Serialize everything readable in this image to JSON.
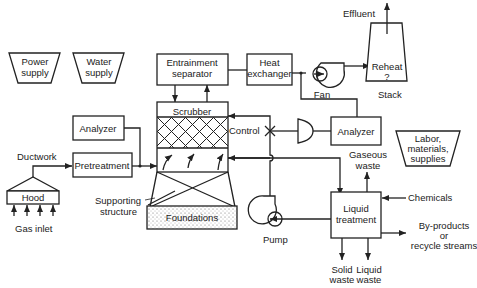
{
  "diagram": {
    "resources": {
      "power": [
        "Power",
        "supply"
      ],
      "water": [
        "Water",
        "supply"
      ],
      "labor": [
        "Labor,",
        "materials,",
        "supplies"
      ]
    },
    "blocks": {
      "entrainment": [
        "Entrainment",
        "separator"
      ],
      "heat_exchanger": [
        "Heat",
        "exchanger"
      ],
      "scrubber": "Scrubber",
      "analyzer_left": "Analyzer",
      "analyzer_right": "Analyzer",
      "pretreatment": "Pretreatment",
      "hood": "Hood",
      "foundations": "Foundations",
      "liquid_treatment": [
        "Liquid",
        "treatment"
      ],
      "stack": [
        "Reheat",
        "?"
      ]
    },
    "labels": {
      "effluent": "Effluent",
      "fan": "Fan",
      "stack": "Stack",
      "control": "Control",
      "ductwork": "Ductwork",
      "gas_inlet": "Gas inlet",
      "supporting": [
        "Supporting",
        "structure"
      ],
      "pump": "Pump",
      "gaseous_waste": [
        "Gaseous",
        "waste"
      ],
      "chemicals": "Chemicals",
      "byproducts": [
        "By-products",
        "or",
        "recycle streams"
      ],
      "solid_waste": [
        "Solid",
        "waste"
      ],
      "liquid_waste": [
        "Liquid",
        "waste"
      ]
    }
  }
}
